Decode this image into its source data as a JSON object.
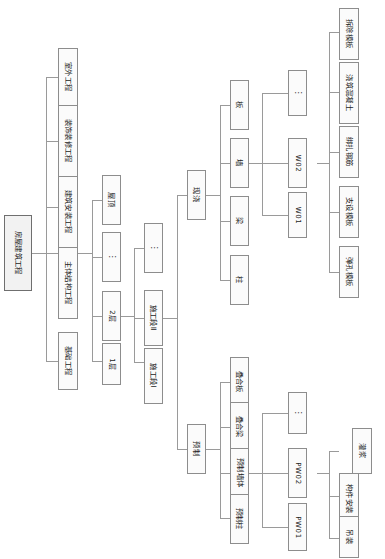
{
  "diagram": {
    "orientation": "rotated-90",
    "root": {
      "label": "房屋建筑工程"
    },
    "level2": [
      {
        "label": "室外工程"
      },
      {
        "label": "装饰装修工程"
      },
      {
        "label": "建筑安装工程"
      },
      {
        "label": "主体结构工程"
      },
      {
        "label": "基础工程"
      }
    ],
    "level3_floors": [
      {
        "label": "屋顶"
      },
      {
        "label": "⋮"
      },
      {
        "label": "2层"
      },
      {
        "label": "1层"
      }
    ],
    "level4_sections": [
      {
        "label": "⋮"
      },
      {
        "label": "施工段Ⅱ"
      },
      {
        "label": "施工段Ⅰ"
      }
    ],
    "level5_methods": [
      {
        "label": "现浇"
      },
      {
        "label": "预制"
      }
    ],
    "level6_cast_in_situ": [
      {
        "label": "板"
      },
      {
        "label": "墙"
      },
      {
        "label": "梁"
      },
      {
        "label": "柱"
      }
    ],
    "level6_precast": [
      {
        "label": "叠合板"
      },
      {
        "label": "叠合梁"
      },
      {
        "label": "预制墙体"
      },
      {
        "label": "预制柱"
      }
    ],
    "level7_wall_units": [
      {
        "label": "⋮"
      },
      {
        "label": "W02"
      },
      {
        "label": "W01"
      }
    ],
    "level7_precast_units": [
      {
        "label": "⋮"
      },
      {
        "label": "PW02"
      },
      {
        "label": "PW01"
      }
    ],
    "level8_processes": [
      {
        "label": "拆除模板"
      },
      {
        "label": "浇筑混凝土"
      },
      {
        "label": "绑扎钢筋"
      },
      {
        "label": "支设模板"
      },
      {
        "label": "弹孔模板"
      }
    ],
    "level8_precast_processes": [
      {
        "label": "灌浆"
      },
      {
        "label": "构件安装"
      },
      {
        "label": "吊装"
      }
    ]
  }
}
